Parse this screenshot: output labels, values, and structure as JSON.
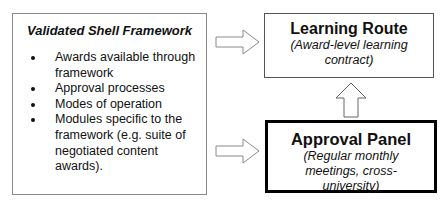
{
  "framework": {
    "title": "Validated Shell Framework",
    "items": [
      "Awards available through framework",
      "Approval processes",
      "Modes of operation",
      "Modules specific to the framework (e.g. suite of negotiated content awards)."
    ]
  },
  "learning_route": {
    "title": "Learning Route",
    "subtitle": "(Award-level learning contract)"
  },
  "approval_panel": {
    "title": "Approval Panel",
    "subtitle": "(Regular monthly meetings, cross-university)"
  },
  "arrows": [
    {
      "from": "framework",
      "to": "learning_route",
      "direction": "right"
    },
    {
      "from": "framework",
      "to": "approval_panel",
      "direction": "right"
    },
    {
      "from": "approval_panel",
      "to": "learning_route",
      "direction": "up"
    }
  ]
}
